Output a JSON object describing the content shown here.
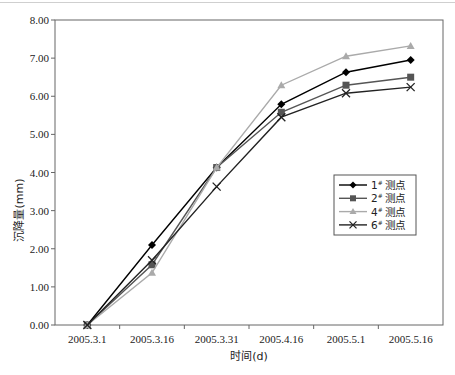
{
  "chart_data": {
    "type": "line",
    "title": "",
    "xlabel": "时间(d)",
    "ylabel": "沉降量(mm)",
    "categories": [
      "2005.3.1",
      "2005.3.16",
      "2005.3.31",
      "2005.4.16",
      "2005.5.1",
      "2005.5.16"
    ],
    "ylim": [
      0,
      8
    ],
    "yticks": [
      "0.00",
      "1.00",
      "2.00",
      "3.00",
      "4.00",
      "5.00",
      "6.00",
      "7.00",
      "8.00"
    ],
    "grid": false,
    "legend_position": "right-middle (inside plot)",
    "series": [
      {
        "name": "1# 测点",
        "marker": "diamond",
        "color": "#000000",
        "values": [
          0.0,
          2.1,
          4.13,
          5.79,
          6.63,
          6.95
        ]
      },
      {
        "name": "2# 测点",
        "marker": "square",
        "color": "#555555",
        "values": [
          0.0,
          1.58,
          4.13,
          5.58,
          6.29,
          6.5
        ]
      },
      {
        "name": "4# 测点",
        "marker": "triangle",
        "color": "#aaaaaa",
        "values": [
          0.0,
          1.37,
          4.13,
          6.29,
          7.05,
          7.32
        ]
      },
      {
        "name": "6# 测点",
        "marker": "x",
        "color": "#222222",
        "values": [
          0.0,
          1.7,
          3.63,
          5.45,
          6.08,
          6.24
        ]
      }
    ]
  },
  "legend": {
    "items": [
      {
        "num": "1",
        "sup": "#",
        "label": "测点"
      },
      {
        "num": "2",
        "sup": "#",
        "label": "测点"
      },
      {
        "num": "4",
        "sup": "#",
        "label": "测点"
      },
      {
        "num": "6",
        "sup": "#",
        "label": "测点"
      }
    ]
  }
}
